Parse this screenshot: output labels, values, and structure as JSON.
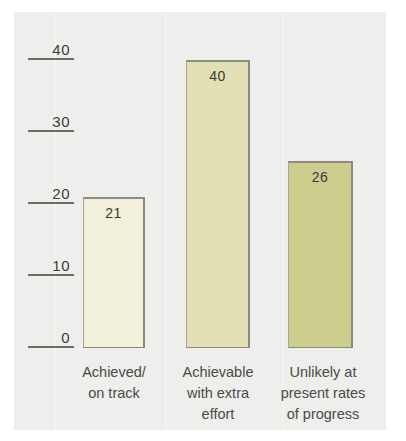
{
  "chart_data": {
    "type": "bar",
    "title": "",
    "subtitle": "",
    "xlabel": "",
    "ylabel": "",
    "ylim": [
      0,
      40
    ],
    "yticks": [
      0,
      10,
      20,
      30,
      40
    ],
    "ytick_labels": [
      "0",
      "10",
      "20",
      "30",
      "40"
    ],
    "grid": false,
    "legend": null,
    "categories": [
      "Achieved/ on track",
      "Achievable with extra effort",
      "Unlikely at present rates of progress"
    ],
    "category_lines": [
      [
        "Achieved/",
        "on track"
      ],
      [
        "Achievable",
        "with extra",
        "effort"
      ],
      [
        "Unlikely at",
        "present rates",
        "of progress"
      ]
    ],
    "values": [
      21,
      40,
      26
    ],
    "value_labels": [
      "21",
      "40",
      "26"
    ],
    "bar_colors": [
      "#f2f0d8",
      "#e2e0b4",
      "#cdcd8e"
    ],
    "bar_edge_color": "#8a8a7e",
    "background_color": "#eeeeec",
    "page_color": "#ffffff",
    "text_color": "#3c3c3a",
    "axis_color": "#6d6d68"
  }
}
